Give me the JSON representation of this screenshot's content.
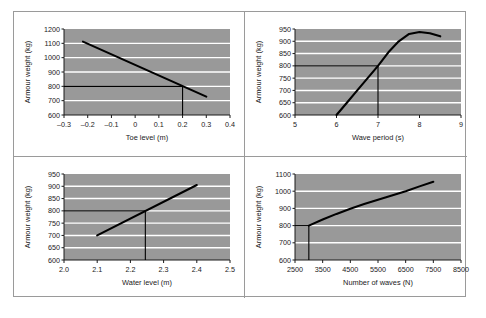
{
  "figure": {
    "panel_count": 4,
    "plot_bg_color": "#999999",
    "gridline_color": "#ffffff",
    "curve_color": "#000000",
    "frame_color": "#9a9a9a"
  },
  "chart_data": [
    {
      "id": "toe-level",
      "position": "top-left",
      "type": "line",
      "title": "",
      "xlabel": "Toe level (m)",
      "ylabel": "Armour weight (kg)",
      "xlim": [
        -0.3,
        0.4
      ],
      "ylim": [
        600,
        1200
      ],
      "xticks": [
        "–0.3",
        "–0.2",
        "–0.1",
        "0",
        "0.1",
        "0.2",
        "0.3",
        "0.4"
      ],
      "xtick_values": [
        -0.3,
        -0.2,
        -0.1,
        0,
        0.1,
        0.2,
        0.3,
        0.4
      ],
      "yticks": [
        "600",
        "700",
        "800",
        "900",
        "1000",
        "1100",
        "1200"
      ],
      "ytick_values": [
        600,
        700,
        800,
        900,
        1000,
        1100,
        1200
      ],
      "grid": true,
      "series": [
        {
          "name": "design curve",
          "x": [
            -0.22,
            0.3
          ],
          "values": [
            1112,
            728
          ]
        }
      ],
      "annotations": [
        {
          "kind": "horizontal-reference-line",
          "y": 800,
          "x_from": -0.3,
          "x_to": 0.2
        },
        {
          "kind": "vertical-reference-line",
          "x": 0.2,
          "y_from": 600,
          "y_to": 800
        }
      ],
      "design_point": {
        "x": 0.2,
        "y": 800
      }
    },
    {
      "id": "wave-period",
      "position": "top-right",
      "type": "line",
      "title": "",
      "xlabel": "Wave period (s)",
      "ylabel": "Armour weight (kg)",
      "xlim": [
        5,
        9
      ],
      "ylim": [
        600,
        950
      ],
      "xticks": [
        "5",
        "6",
        "7",
        "8",
        "9"
      ],
      "xtick_values": [
        5,
        6,
        7,
        8,
        9
      ],
      "yticks": [
        "600",
        "650",
        "700",
        "750",
        "800",
        "850",
        "900",
        "950"
      ],
      "ytick_values": [
        600,
        650,
        700,
        750,
        800,
        850,
        900,
        950
      ],
      "grid": true,
      "series": [
        {
          "name": "design curve",
          "x": [
            6.0,
            6.25,
            6.5,
            6.75,
            7.0,
            7.25,
            7.5,
            7.75,
            8.0,
            8.25,
            8.5
          ],
          "values": [
            600,
            650,
            700,
            750,
            800,
            855,
            900,
            930,
            938,
            933,
            920
          ]
        }
      ],
      "annotations": [
        {
          "kind": "horizontal-reference-line",
          "y": 800,
          "x_from": 5,
          "x_to": 7
        },
        {
          "kind": "vertical-reference-line",
          "x": 7,
          "y_from": 600,
          "y_to": 800
        }
      ],
      "design_point": {
        "x": 7,
        "y": 800
      }
    },
    {
      "id": "water-level",
      "position": "bottom-left",
      "type": "line",
      "title": "",
      "xlabel": "Water level (m)",
      "ylabel": "Armour weight (kg)",
      "xlim": [
        2.0,
        2.5
      ],
      "ylim": [
        600,
        950
      ],
      "xticks": [
        "2.0",
        "2.1",
        "2.2",
        "2.3",
        "2.4",
        "2.5"
      ],
      "xtick_values": [
        2.0,
        2.1,
        2.2,
        2.3,
        2.4,
        2.5
      ],
      "yticks": [
        "600",
        "650",
        "700",
        "750",
        "800",
        "850",
        "900",
        "950"
      ],
      "ytick_values": [
        600,
        650,
        700,
        750,
        800,
        850,
        900,
        950
      ],
      "grid": true,
      "series": [
        {
          "name": "design curve",
          "x": [
            2.1,
            2.4
          ],
          "values": [
            700,
            905
          ]
        }
      ],
      "annotations": [
        {
          "kind": "horizontal-reference-line",
          "y": 800,
          "x_from": 2.0,
          "x_to": 2.245
        },
        {
          "kind": "vertical-reference-line",
          "x": 2.245,
          "y_from": 600,
          "y_to": 800
        }
      ],
      "design_point": {
        "x": 2.245,
        "y": 800
      }
    },
    {
      "id": "number-of-waves",
      "position": "bottom-right",
      "type": "line",
      "title": "",
      "xlabel": "Number of waves (N)",
      "ylabel": "Armour weight (kg)",
      "xlim": [
        2500,
        8500
      ],
      "ylim": [
        600,
        1100
      ],
      "xticks": [
        "2500",
        "3500",
        "4500",
        "5500",
        "6500",
        "7500",
        "8500"
      ],
      "xtick_values": [
        2500,
        3500,
        4500,
        5500,
        6500,
        7500,
        8500
      ],
      "yticks": [
        "600",
        "700",
        "800",
        "900",
        "1000",
        "1100"
      ],
      "ytick_values": [
        600,
        700,
        800,
        900,
        1000,
        1100
      ],
      "grid": true,
      "series": [
        {
          "name": "design curve",
          "x": [
            3000,
            3500,
            4000,
            4500,
            5000,
            5500,
            6000,
            6500,
            7000,
            7500
          ],
          "values": [
            800,
            835,
            868,
            898,
            925,
            950,
            975,
            1000,
            1028,
            1055
          ]
        }
      ],
      "annotations": [
        {
          "kind": "vertical-reference-line",
          "x": 3000,
          "y_from": 600,
          "y_to": 800
        },
        {
          "kind": "horizontal-reference-line",
          "y": 800,
          "x_from": 2500,
          "x_to": 3000
        }
      ],
      "design_point": {
        "x": 3000,
        "y": 800
      }
    }
  ]
}
